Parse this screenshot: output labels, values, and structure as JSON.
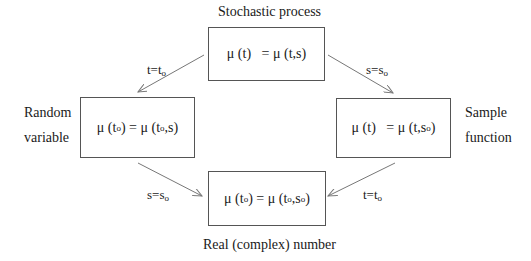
{
  "title_top": "Stochastic process",
  "title_bottom": "Real (complex) number",
  "left_label": {
    "line1": "Random",
    "line2": "variable"
  },
  "right_label": {
    "line1": "Sample",
    "line2": "function"
  },
  "boxes": {
    "top": {
      "lhs": "μ (t)",
      "rhs": "= μ (t,s)"
    },
    "left": {
      "lhs_pre": "μ (t",
      "lhs_sub": "o",
      "lhs_post": ") = μ (t",
      "rhs_sub": "o",
      "rhs_post": ",s)"
    },
    "right": {
      "lhs": "μ (t)",
      "rhs_pre": "= μ (t,s",
      "rhs_sub": "o",
      "rhs_post": ")"
    },
    "bottom": {
      "a": "μ (t",
      "a_sub": "o",
      "b": ") = μ (t",
      "b_sub": "o",
      "c": ",s",
      "c_sub": "o",
      "d": ")"
    }
  },
  "arrows": {
    "top_left": {
      "pre": "t=t",
      "sub": "o"
    },
    "top_right": {
      "pre": "s=s",
      "sub": "o"
    },
    "bottom_left": {
      "pre": "s=s",
      "sub": "o"
    },
    "bottom_right": {
      "pre": "t=t",
      "sub": "o"
    }
  }
}
